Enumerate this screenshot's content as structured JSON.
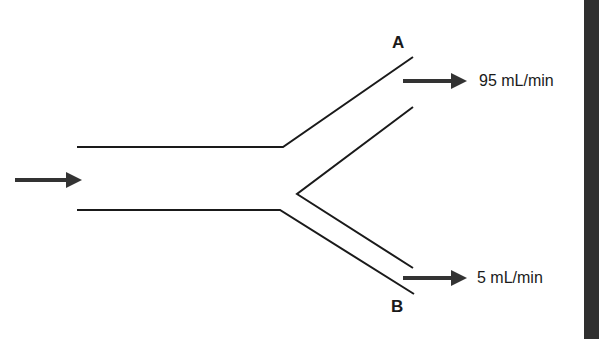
{
  "diagram": {
    "type": "branching tube flow diagram",
    "inlet": {
      "arrow": "right-arrow"
    },
    "branches": [
      {
        "id": "A",
        "label": "A",
        "flow_label": "95 mL/min",
        "position": "upper"
      },
      {
        "id": "B",
        "label": "B",
        "flow_label": "5 mL/min",
        "position": "lower"
      }
    ],
    "colors": {
      "line": "#1a1a1a",
      "arrow": "#333333",
      "bar": "#2f2f2f",
      "background": "#ffffff"
    }
  }
}
